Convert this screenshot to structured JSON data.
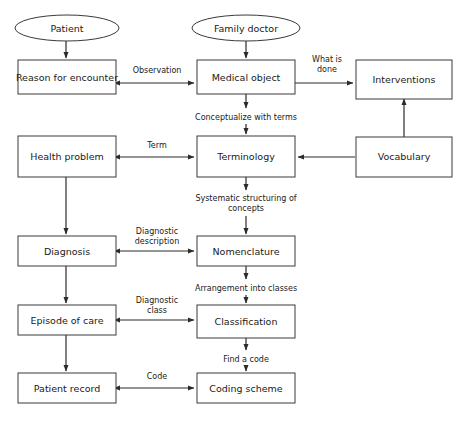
{
  "diagram": {
    "background_color": "#ffffff",
    "line_color": "#2b2b2b",
    "box_stroke_color": "#3a3a3a",
    "text_color": "#1a1a1a",
    "nodes": [
      {
        "id": "patient",
        "shape": "ellipse",
        "label": "Patient"
      },
      {
        "id": "family_doctor",
        "shape": "ellipse",
        "label": "Family doctor"
      },
      {
        "id": "reason_encounter",
        "shape": "box",
        "label": "Reason for encounter"
      },
      {
        "id": "medical_object",
        "shape": "box",
        "label": "Medical object"
      },
      {
        "id": "interventions",
        "shape": "box",
        "label": "Interventions"
      },
      {
        "id": "health_problem",
        "shape": "box",
        "label": "Health problem"
      },
      {
        "id": "terminology",
        "shape": "box",
        "label": "Terminology"
      },
      {
        "id": "vocabulary",
        "shape": "box",
        "label": "Vocabulary"
      },
      {
        "id": "diagnosis",
        "shape": "box",
        "label": "Diagnosis"
      },
      {
        "id": "nomenclature",
        "shape": "box",
        "label": "Nomenclature"
      },
      {
        "id": "episode_of_care",
        "shape": "box",
        "label": "Episode of care"
      },
      {
        "id": "classification",
        "shape": "box",
        "label": "Classification"
      },
      {
        "id": "patient_record",
        "shape": "box",
        "label": "Patient record"
      },
      {
        "id": "coding_scheme",
        "shape": "box",
        "label": "Coding scheme"
      }
    ],
    "edges": [
      {
        "id": "e_patient_reason",
        "from": "patient",
        "to": "reason_encounter",
        "label": "",
        "label_lines": []
      },
      {
        "id": "e_doctor_medical",
        "from": "family_doctor",
        "to": "medical_object",
        "label": "",
        "label_lines": []
      },
      {
        "id": "e_reason_medical",
        "from": "reason_encounter",
        "to": "medical_object",
        "label": "Observation",
        "label_lines": [
          "Observation"
        ]
      },
      {
        "id": "e_medical_interventions",
        "from": "medical_object",
        "to": "interventions",
        "label": "What is done",
        "label_lines": [
          "What is",
          "done"
        ]
      },
      {
        "id": "e_medical_terminology",
        "from": "medical_object",
        "to": "terminology",
        "label": "Conceptualize with terms",
        "label_lines": [
          "Conceptualize with terms"
        ]
      },
      {
        "id": "e_health_terminology",
        "from": "health_problem",
        "to": "terminology",
        "label": "Term",
        "label_lines": [
          "Term"
        ]
      },
      {
        "id": "e_vocabulary_terminology",
        "from": "vocabulary",
        "to": "terminology",
        "label": "",
        "label_lines": []
      },
      {
        "id": "e_vocabulary_interventions",
        "from": "vocabulary",
        "to": "interventions",
        "label": "",
        "label_lines": []
      },
      {
        "id": "e_terminology_nomenclature",
        "from": "terminology",
        "to": "nomenclature",
        "label": "Systematic structuring of concepts",
        "label_lines": [
          "Systematic structuring of",
          "concepts"
        ]
      },
      {
        "id": "e_health_diagnosis",
        "from": "health_problem",
        "to": "diagnosis",
        "label": "",
        "label_lines": []
      },
      {
        "id": "e_diagnosis_nomenclature",
        "from": "diagnosis",
        "to": "nomenclature",
        "label": "Diagnostic description",
        "label_lines": [
          "Diagnostic",
          "description"
        ]
      },
      {
        "id": "e_nomenclature_classification",
        "from": "nomenclature",
        "to": "classification",
        "label": "Arrangement into classes",
        "label_lines": [
          "Arrangement into classes"
        ]
      },
      {
        "id": "e_diagnosis_episode",
        "from": "diagnosis",
        "to": "episode_of_care",
        "label": "",
        "label_lines": []
      },
      {
        "id": "e_episode_classification",
        "from": "episode_of_care",
        "to": "classification",
        "label": "Diagnostic class",
        "label_lines": [
          "Diagnostic",
          "class"
        ]
      },
      {
        "id": "e_classification_coding",
        "from": "classification",
        "to": "coding_scheme",
        "label": "Find a code",
        "label_lines": [
          "Find a code"
        ]
      },
      {
        "id": "e_episode_record",
        "from": "episode_of_care",
        "to": "patient_record",
        "label": "",
        "label_lines": []
      },
      {
        "id": "e_record_coding",
        "from": "patient_record",
        "to": "coding_scheme",
        "label": "Code",
        "label_lines": [
          "Code"
        ]
      }
    ]
  }
}
